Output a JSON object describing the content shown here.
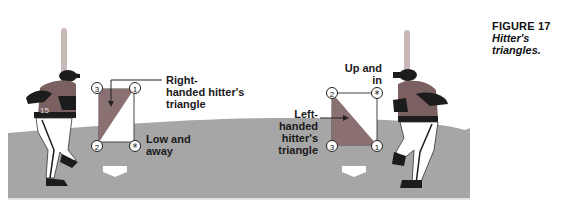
{
  "figure": {
    "number_label": "FIGURE 17",
    "title": "Hitter's triangles."
  },
  "colors": {
    "field": "#a6a6a6",
    "field_edge": "#d9d9d9",
    "triangle_fill": "#8a7070",
    "box_stroke": "#333333",
    "jersey": "#7a6060",
    "dark": "#1c1c1c",
    "bat": "#c8b8b8",
    "plate": "#ffffff"
  },
  "left_panel": {
    "callout_label_line1": "Right-",
    "callout_label_line2": "handed hitter's",
    "callout_label_line3": "triangle",
    "corner_label_line1": "Low and",
    "corner_label_line2": "away",
    "markers": {
      "top_left": "3",
      "top_right": "1",
      "bottom_left": "2",
      "bottom_right": "*"
    },
    "jersey_number": "15"
  },
  "right_panel": {
    "callout_label_line1": "Left-",
    "callout_label_line2": "handed hitter's",
    "callout_label_line3": "triangle",
    "corner_label_line1": "Up and",
    "corner_label_line2": "in",
    "markers": {
      "top_left": "2",
      "top_right": "*",
      "bottom_left": "3",
      "bottom_right": "1"
    }
  }
}
